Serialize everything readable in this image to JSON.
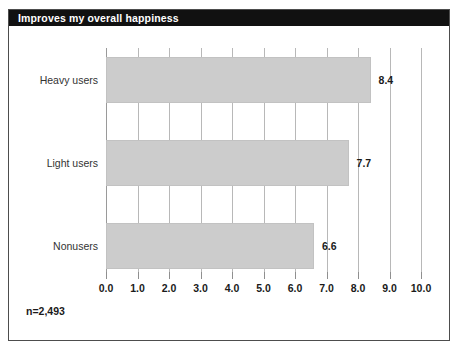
{
  "figure": {
    "title": "Improves my overall happiness",
    "footnote": "n=2,493"
  },
  "colors": {
    "title_bar_bg": "#111111",
    "title_text": "#ffffff",
    "bar_fill": "#cccccc",
    "bar_border": "#c2c2c2",
    "gridline": "#b8b8b8",
    "frame": "#4d4d4d",
    "label_text": "#1a1a1a",
    "category_text": "#333333"
  },
  "chart_data": {
    "type": "bar",
    "orientation": "horizontal",
    "title": "Improves my overall happiness",
    "xlabel": "",
    "ylabel": "",
    "categories": [
      "Heavy users",
      "Light users",
      "Nonusers"
    ],
    "values": [
      8.4,
      7.7,
      6.6
    ],
    "value_labels": [
      "8.4",
      "7.7",
      "6.6"
    ],
    "xlim": [
      0.0,
      10.0
    ],
    "xticks": [
      0.0,
      1.0,
      2.0,
      3.0,
      4.0,
      5.0,
      6.0,
      7.0,
      8.0,
      9.0,
      10.0
    ],
    "xticklabels": [
      "0.0",
      "1.0",
      "2.0",
      "3.0",
      "4.0",
      "5.0",
      "6.0",
      "7.0",
      "8.0",
      "9.0",
      "10.0"
    ],
    "grid": true,
    "grid_axis": "x",
    "legend": false,
    "annotations": [
      "n=2,493"
    ]
  }
}
